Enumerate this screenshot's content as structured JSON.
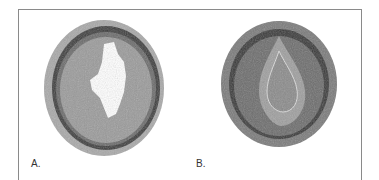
{
  "figure": {
    "panels": [
      {
        "label": "A.",
        "description": "Artery cross-section with irregular open lumen"
      },
      {
        "label": "B.",
        "description": "Artery cross-section with occluded lumen"
      }
    ],
    "colors": {
      "border": "#8a8a8a",
      "tissue_dark": "#3a3a3a",
      "tissue_mid": "#8c8c8c",
      "tissue_light": "#b5b5b5"
    }
  }
}
